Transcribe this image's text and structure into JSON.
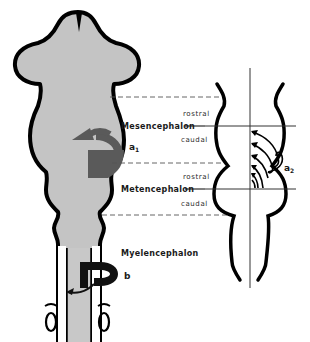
{
  "figure": {
    "colors": {
      "tissue_fill": "#c4c4c4",
      "outline": "#000000",
      "arrow_a1": "#5a5a5a",
      "arrow_b": "#111111",
      "dashed_line": "#555555",
      "axis_line": "#333333"
    }
  },
  "labels": {
    "regions": {
      "mesencephalon": "Mesencephalon",
      "metencephalon": "Metencephalon",
      "myelencephalon": "Myelencephalon"
    },
    "orientation": {
      "mes_rostral": "rostral",
      "mes_caudal": "caudal",
      "met_rostral": "rostral",
      "met_caudal": "caudal"
    },
    "markers": {
      "a1_letter": "a",
      "a1_sub": "1",
      "a2_letter": "a",
      "a2_sub": "2",
      "b": "b"
    }
  }
}
